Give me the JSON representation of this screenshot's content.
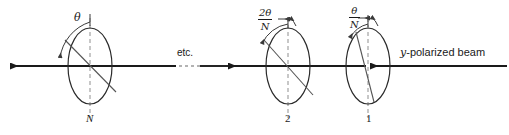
{
  "figure": {
    "kind": "optics-diagram",
    "width": 509,
    "height": 135,
    "background": "#ffffff",
    "line_color": "#1a1a1a",
    "thin_line_color": "#555555",
    "dashed_color": "#8a8a8a"
  },
  "beam": {
    "label_prefix": "y",
    "label_rest": "-polarized beam",
    "direction": "right-to-left",
    "etc_label": "etc."
  },
  "polarizers": [
    {
      "id": "polarizer-N",
      "bottom_label": "N",
      "angle_label": "θ",
      "angle_label_kind": "plain",
      "axis_tilt_deg": 35
    },
    {
      "id": "polarizer-2",
      "bottom_label": "2",
      "angle_numerator": "2θ",
      "angle_denominator": "N",
      "angle_label_kind": "fraction",
      "axis_tilt_deg": 38
    },
    {
      "id": "polarizer-1",
      "bottom_label": "1",
      "angle_numerator": "θ",
      "angle_denominator": "N",
      "angle_label_kind": "fraction",
      "axis_tilt_deg": 12
    }
  ]
}
